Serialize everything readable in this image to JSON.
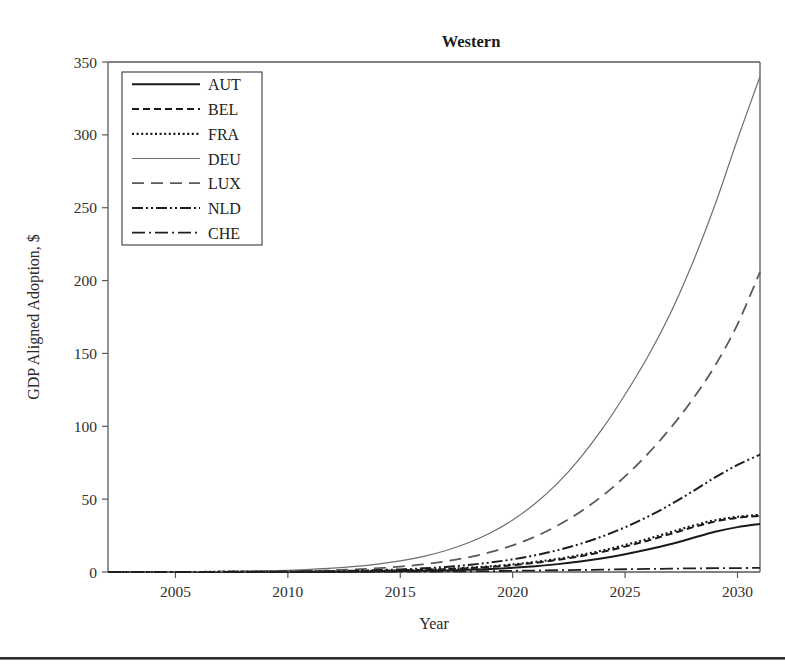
{
  "figure": {
    "title": "Western",
    "background_color": "#ffffff"
  },
  "axes": {
    "x": {
      "label": "Year",
      "ticks": [
        "2005",
        "2010",
        "2015",
        "2020",
        "2025",
        "2030"
      ],
      "tick_values": [
        2005,
        2010,
        2015,
        2020,
        2025,
        2030
      ],
      "min": 2002,
      "max": 2031
    },
    "y": {
      "label": "GDP Aligned Adoption, $",
      "ticks": [
        "0",
        "50",
        "100",
        "150",
        "200",
        "250",
        "300",
        "350"
      ],
      "tick_values": [
        0,
        50,
        100,
        150,
        200,
        250,
        300,
        350
      ],
      "min": 0,
      "max": 350
    }
  },
  "legend": {
    "position": "upper-left",
    "entries": [
      {
        "label": "AUT",
        "style": "solid",
        "color": "#1a1a1a",
        "width": 2.0,
        "dash": ""
      },
      {
        "label": "BEL",
        "style": "dashed-short",
        "color": "#1a1a1a",
        "width": 2.0,
        "dash": "7,4"
      },
      {
        "label": "FRA",
        "style": "dotted",
        "color": "#1a1a1a",
        "width": 2.2,
        "dash": "2,2.6"
      },
      {
        "label": "DEU",
        "style": "solid-thin",
        "color": "#6e6e6e",
        "width": 1.2,
        "dash": ""
      },
      {
        "label": "LUX",
        "style": "dashed-long",
        "color": "#5a5a5a",
        "width": 1.8,
        "dash": "12,7"
      },
      {
        "label": "NLD",
        "style": "dash-dot-dot",
        "color": "#1f1f1f",
        "width": 2.0,
        "dash": "11,3,2,3,2,3"
      },
      {
        "label": "CHE",
        "style": "dash-dot",
        "color": "#1f1f1f",
        "width": 1.8,
        "dash": "13,4,2,4"
      }
    ]
  },
  "chart_data": {
    "type": "line",
    "title": "Western",
    "xlabel": "Year",
    "ylabel": "GDP Aligned Adoption, $",
    "xlim": [
      2002,
      2031
    ],
    "ylim": [
      0,
      350
    ],
    "grid": false,
    "legend_position": "upper-left",
    "x": [
      2002,
      2003,
      2004,
      2005,
      2006,
      2007,
      2008,
      2009,
      2010,
      2011,
      2012,
      2013,
      2014,
      2015,
      2016,
      2017,
      2018,
      2019,
      2020,
      2021,
      2022,
      2023,
      2024,
      2025,
      2026,
      2027,
      2028,
      2029,
      2030,
      2031
    ],
    "series": [
      {
        "name": "AUT",
        "values": [
          0.0,
          0.0,
          0.0,
          0.0,
          0.0,
          0.0,
          0.0,
          0.1,
          0.1,
          0.1,
          0.2,
          0.3,
          0.4,
          0.6,
          0.8,
          1.1,
          1.5,
          2.1,
          2.9,
          4.0,
          5.4,
          7.2,
          9.5,
          12.2,
          15.4,
          19.1,
          23.3,
          27.6,
          30.8,
          33.0
        ]
      },
      {
        "name": "BEL",
        "values": [
          0.0,
          0.0,
          0.0,
          0.0,
          0.0,
          0.1,
          0.1,
          0.1,
          0.2,
          0.3,
          0.4,
          0.5,
          0.7,
          1.0,
          1.4,
          1.9,
          2.6,
          3.5,
          4.7,
          6.3,
          8.3,
          10.8,
          13.8,
          17.4,
          21.5,
          26.0,
          30.6,
          34.6,
          37.2,
          38.5
        ]
      },
      {
        "name": "FRA",
        "values": [
          0.0,
          0.0,
          0.0,
          0.0,
          0.0,
          0.1,
          0.1,
          0.1,
          0.2,
          0.3,
          0.4,
          0.6,
          0.8,
          1.1,
          1.5,
          2.1,
          2.9,
          3.9,
          5.2,
          6.9,
          9.0,
          11.6,
          14.8,
          18.5,
          22.7,
          27.2,
          31.7,
          35.5,
          37.9,
          39.2
        ]
      },
      {
        "name": "DEU",
        "values": [
          0.0,
          0.0,
          0.1,
          0.1,
          0.2,
          0.3,
          0.5,
          0.8,
          1.2,
          1.8,
          2.6,
          3.8,
          5.4,
          7.6,
          10.6,
          14.6,
          19.9,
          26.8,
          35.7,
          47.0,
          61.0,
          78.2,
          98.5,
          121.8,
          147.5,
          134.0,
          0,
          0,
          0,
          0
        ]
      },
      {
        "name": "LUX",
        "values": [
          0.0,
          0.0,
          0.0,
          0.0,
          0.1,
          0.1,
          0.2,
          0.3,
          0.5,
          0.8,
          1.2,
          1.8,
          2.6,
          3.7,
          5.2,
          7.3,
          10.0,
          13.6,
          18.3,
          24.3,
          31.9,
          41.2,
          52.4,
          65.6,
          80.9,
          98.4,
          118.4,
          141.6,
          170.0,
          206.0
        ]
      },
      {
        "name": "NLD",
        "values": [
          0.0,
          0.0,
          0.0,
          0.0,
          0.0,
          0.1,
          0.1,
          0.2,
          0.3,
          0.4,
          0.6,
          0.9,
          1.3,
          1.8,
          2.5,
          3.5,
          4.8,
          6.5,
          8.7,
          11.5,
          15.0,
          19.3,
          24.5,
          30.7,
          37.9,
          46.1,
          55.3,
          64.9,
          73.5,
          80.5
        ]
      },
      {
        "name": "CHE",
        "values": [
          0.0,
          0.0,
          0.0,
          0.0,
          0.0,
          0.0,
          0.0,
          0.0,
          0.0,
          0.1,
          0.1,
          0.1,
          0.2,
          0.2,
          0.3,
          0.4,
          0.5,
          0.6,
          0.8,
          1.0,
          1.2,
          1.4,
          1.6,
          1.9,
          2.1,
          2.3,
          2.5,
          2.6,
          2.7,
          2.8
        ]
      }
    ]
  }
}
